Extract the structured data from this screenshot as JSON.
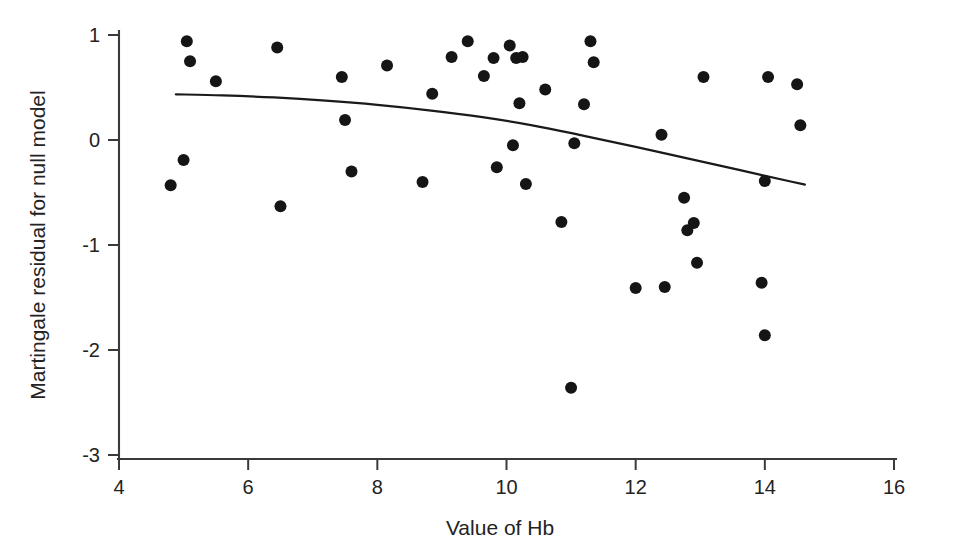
{
  "chart_data": {
    "type": "scatter",
    "title": "",
    "xlabel": "Value of Hb",
    "ylabel": "Martingale residual for null model",
    "xlim": [
      4,
      16
    ],
    "ylim": [
      -3,
      1
    ],
    "xticks": [
      4,
      6,
      8,
      10,
      12,
      14,
      16
    ],
    "yticks": [
      1,
      0,
      -1,
      -2,
      -3
    ],
    "xtick_labels": [
      "4",
      "6",
      "8",
      "10",
      "12",
      "14",
      "16"
    ],
    "ytick_labels": [
      "1",
      "0",
      "-1",
      "-2",
      "-3"
    ],
    "grid": false,
    "legend": false,
    "marker": "filled-circle",
    "marker_color": "#151515",
    "marker_size": 6,
    "points": [
      {
        "x": 4.8,
        "y": -0.43
      },
      {
        "x": 5.0,
        "y": -0.19
      },
      {
        "x": 5.05,
        "y": 0.94
      },
      {
        "x": 5.1,
        "y": 0.75
      },
      {
        "x": 5.5,
        "y": 0.56
      },
      {
        "x": 6.45,
        "y": 0.88
      },
      {
        "x": 6.5,
        "y": -0.63
      },
      {
        "x": 7.45,
        "y": 0.6
      },
      {
        "x": 7.5,
        "y": 0.19
      },
      {
        "x": 7.6,
        "y": -0.3
      },
      {
        "x": 8.15,
        "y": 0.71
      },
      {
        "x": 8.7,
        "y": -0.4
      },
      {
        "x": 8.85,
        "y": 0.44
      },
      {
        "x": 9.15,
        "y": 0.79
      },
      {
        "x": 9.4,
        "y": 0.94
      },
      {
        "x": 9.65,
        "y": 0.61
      },
      {
        "x": 9.8,
        "y": 0.78
      },
      {
        "x": 9.85,
        "y": -0.26
      },
      {
        "x": 10.05,
        "y": 0.9
      },
      {
        "x": 10.1,
        "y": -0.05
      },
      {
        "x": 10.15,
        "y": 0.78
      },
      {
        "x": 10.2,
        "y": 0.35
      },
      {
        "x": 10.25,
        "y": 0.79
      },
      {
        "x": 10.3,
        "y": -0.42
      },
      {
        "x": 10.6,
        "y": 0.48
      },
      {
        "x": 10.85,
        "y": -0.78
      },
      {
        "x": 11.0,
        "y": -2.36
      },
      {
        "x": 11.05,
        "y": -0.03
      },
      {
        "x": 11.2,
        "y": 0.34
      },
      {
        "x": 11.3,
        "y": 0.94
      },
      {
        "x": 11.35,
        "y": 0.74
      },
      {
        "x": 12.0,
        "y": -1.41
      },
      {
        "x": 12.4,
        "y": 0.05
      },
      {
        "x": 12.45,
        "y": -1.4
      },
      {
        "x": 12.75,
        "y": -0.55
      },
      {
        "x": 12.8,
        "y": -0.86
      },
      {
        "x": 12.9,
        "y": -0.79
      },
      {
        "x": 12.95,
        "y": -1.17
      },
      {
        "x": 13.05,
        "y": 0.6
      },
      {
        "x": 13.95,
        "y": -1.36
      },
      {
        "x": 14.0,
        "y": -0.39
      },
      {
        "x": 14.0,
        "y": -1.86
      },
      {
        "x": 14.05,
        "y": 0.6
      },
      {
        "x": 14.5,
        "y": 0.53
      },
      {
        "x": 14.55,
        "y": 0.14
      }
    ],
    "smoother": {
      "name": "lowess-smoother",
      "color": "#1a1a1a",
      "x": [
        4.88,
        5.6,
        6.4,
        7.2,
        8.0,
        8.8,
        9.6,
        10.4,
        11.2,
        12.0,
        12.8,
        13.6,
        14.4,
        14.62
      ],
      "y": [
        0.435,
        0.425,
        0.405,
        0.375,
        0.335,
        0.283,
        0.22,
        0.14,
        0.04,
        -0.065,
        -0.175,
        -0.285,
        -0.395,
        -0.425
      ]
    }
  },
  "colors": {
    "background": "#ffffff",
    "axis": "#3a3a3a",
    "text": "#232323",
    "marker": "#151515",
    "line": "#1a1a1a"
  }
}
